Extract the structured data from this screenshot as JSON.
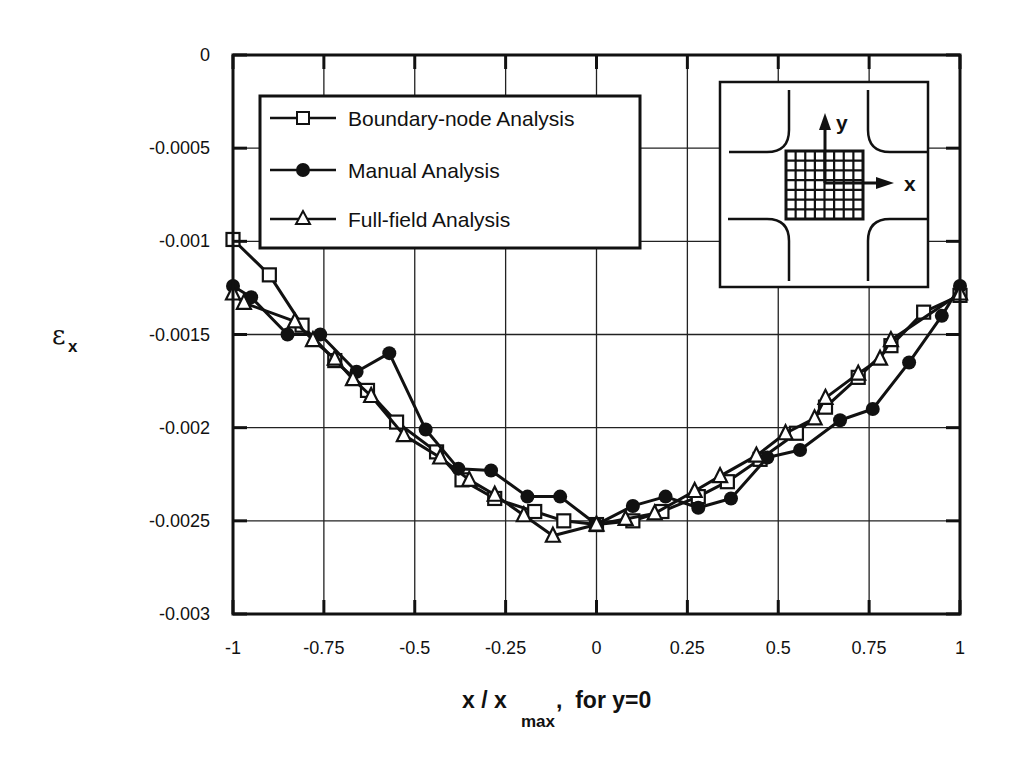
{
  "chart_data": {
    "type": "line",
    "title": "",
    "xlabel": "x / x_max, for y=0",
    "xlabel_parts": {
      "main": "x / x",
      "sub": "max",
      "suffix": ",  for y=0"
    },
    "ylabel": "ε_x",
    "ylabel_parts": {
      "main": "ε",
      "sub": "x"
    },
    "xlim": [
      -1,
      1
    ],
    "ylim": [
      -0.003,
      0
    ],
    "grid": true,
    "legend_position": "upper-left inside",
    "x_ticks": [
      -1,
      -0.75,
      -0.5,
      -0.25,
      0,
      0.25,
      0.5,
      0.75,
      1
    ],
    "x_tick_labels": [
      "-1",
      "-0.75",
      "-0.5",
      "-0.25",
      "0",
      "0.25",
      "0.5",
      "0.75",
      "1"
    ],
    "y_ticks": [
      0,
      -0.0005,
      -0.001,
      -0.0015,
      -0.002,
      -0.0025,
      -0.003
    ],
    "y_tick_labels": [
      "0",
      "-0.0005",
      "-0.001",
      "-0.0015",
      "-0.002",
      "-0.0025",
      "-0.003"
    ],
    "series": [
      {
        "name": "Boundary-node Analysis",
        "marker": "open-square",
        "x": [
          -1.0,
          -0.9,
          -0.81,
          -0.72,
          -0.63,
          -0.55,
          -0.44,
          -0.37,
          -0.28,
          -0.17,
          -0.09,
          0.0,
          0.1,
          0.18,
          0.28,
          0.36,
          0.45,
          0.55,
          0.63,
          0.72,
          0.81,
          0.9,
          1.0
        ],
        "values": [
          -0.00099,
          -0.00118,
          -0.00145,
          -0.00164,
          -0.0018,
          -0.00197,
          -0.00213,
          -0.00228,
          -0.00238,
          -0.00245,
          -0.0025,
          -0.00252,
          -0.0025,
          -0.00245,
          -0.00237,
          -0.00229,
          -0.00217,
          -0.00203,
          -0.00189,
          -0.00173,
          -0.00156,
          -0.00138,
          -0.00129
        ]
      },
      {
        "name": "Manual Analysis",
        "marker": "filled-circle",
        "x": [
          -1.0,
          -0.95,
          -0.85,
          -0.76,
          -0.66,
          -0.57,
          -0.47,
          -0.38,
          -0.29,
          -0.19,
          -0.1,
          0.0,
          0.1,
          0.19,
          0.28,
          0.37,
          0.47,
          0.56,
          0.67,
          0.76,
          0.86,
          0.95,
          1.0
        ],
        "values": [
          -0.00124,
          -0.0013,
          -0.0015,
          -0.0015,
          -0.0017,
          -0.0016,
          -0.00201,
          -0.00222,
          -0.00223,
          -0.00237,
          -0.00237,
          -0.00252,
          -0.00242,
          -0.00237,
          -0.00243,
          -0.00238,
          -0.00216,
          -0.00212,
          -0.00196,
          -0.0019,
          -0.00165,
          -0.0014,
          -0.00124
        ]
      },
      {
        "name": "Full-field Analysis",
        "marker": "open-triangle",
        "x": [
          -1.0,
          -0.97,
          -0.83,
          -0.78,
          -0.72,
          -0.67,
          -0.62,
          -0.53,
          -0.43,
          -0.35,
          -0.28,
          -0.2,
          -0.12,
          0.0,
          0.08,
          0.16,
          0.27,
          0.34,
          0.44,
          0.52,
          0.6,
          0.63,
          0.72,
          0.78,
          0.81,
          1.0
        ],
        "values": [
          -0.00128,
          -0.00133,
          -0.00143,
          -0.00153,
          -0.00163,
          -0.00174,
          -0.00183,
          -0.00204,
          -0.00216,
          -0.00228,
          -0.00236,
          -0.00247,
          -0.00258,
          -0.00252,
          -0.00249,
          -0.00246,
          -0.00234,
          -0.00226,
          -0.00215,
          -0.00203,
          -0.00195,
          -0.00184,
          -0.00171,
          -0.00163,
          -0.00153,
          -0.00128
        ]
      }
    ],
    "inset": {
      "description": "cruciform specimen with measurement grid at center",
      "axis_labels": [
        "y",
        "x"
      ],
      "grid_cols": 8,
      "grid_rows": 7
    }
  },
  "legend": {
    "items": [
      {
        "label": "Boundary-node Analysis",
        "marker": "open-square"
      },
      {
        "label": "Manual Analysis",
        "marker": "filled-circle"
      },
      {
        "label": "Full-field Analysis",
        "marker": "open-triangle"
      }
    ]
  },
  "colors": {
    "ink": "#111111",
    "grid": "#222222",
    "background": "#ffffff"
  }
}
